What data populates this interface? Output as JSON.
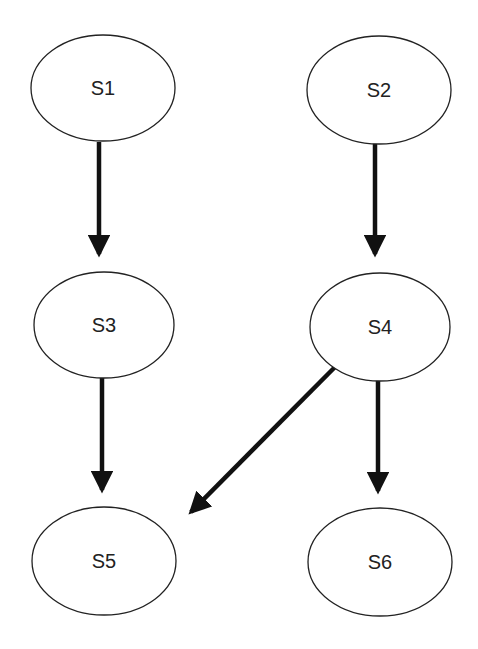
{
  "diagram": {
    "type": "directed-graph",
    "colors": {
      "background": "#ffffff",
      "stroke": "#222222",
      "edge": "#111111"
    },
    "nodes": [
      {
        "id": "S1",
        "label": "S1",
        "cx": 103,
        "cy": 88,
        "rx": 72,
        "ry": 53
      },
      {
        "id": "S2",
        "label": "S2",
        "cx": 379,
        "cy": 90,
        "rx": 72,
        "ry": 54
      },
      {
        "id": "S3",
        "label": "S3",
        "cx": 104,
        "cy": 325,
        "rx": 70,
        "ry": 53
      },
      {
        "id": "S4",
        "label": "S4",
        "cx": 380,
        "cy": 327,
        "rx": 70,
        "ry": 54
      },
      {
        "id": "S5",
        "label": "S5",
        "cx": 104,
        "cy": 561,
        "rx": 72,
        "ry": 54
      },
      {
        "id": "S6",
        "label": "S6",
        "cx": 380,
        "cy": 562,
        "rx": 72,
        "ry": 54
      }
    ],
    "edges": [
      {
        "from": "S1",
        "to": "S3",
        "x1": 99,
        "y1": 142,
        "x2": 99,
        "y2": 254
      },
      {
        "from": "S2",
        "to": "S4",
        "x1": 375,
        "y1": 142,
        "x2": 375,
        "y2": 254
      },
      {
        "from": "S3",
        "to": "S5",
        "x1": 102,
        "y1": 378,
        "x2": 102,
        "y2": 490
      },
      {
        "from": "S4",
        "to": "S6",
        "x1": 378,
        "y1": 380,
        "x2": 378,
        "y2": 491
      },
      {
        "from": "S4",
        "to": "S5",
        "x1": 335,
        "y1": 367,
        "x2": 191,
        "y2": 512
      }
    ]
  }
}
